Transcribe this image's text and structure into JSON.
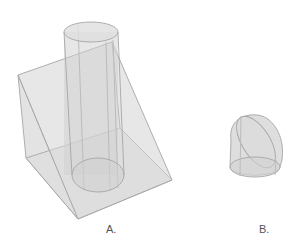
{
  "figure": {
    "labels": {
      "a": "A.",
      "b": "B."
    },
    "shapes": {
      "a": "wedge-with-cylinder",
      "b": "truncated-cylinder"
    },
    "colors": {
      "fill": "#d6d6d6",
      "stroke": "#a0a0a0",
      "background": "#ffffff"
    }
  }
}
